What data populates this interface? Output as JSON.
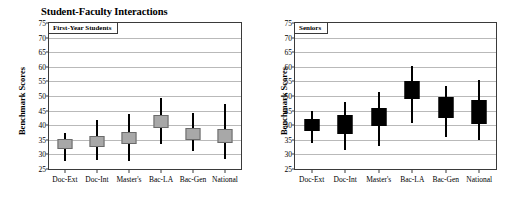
{
  "figure": {
    "title": "Student-Faculty Interactions",
    "y_axis_title": "Benchmark Scores"
  },
  "panels": [
    {
      "label": "First-Year Students"
    },
    {
      "label": "Seniors"
    }
  ],
  "axis": {
    "ticks": [
      "75",
      "70",
      "65",
      "60",
      "55",
      "50",
      "45",
      "40",
      "35",
      "30",
      "25"
    ],
    "categories": [
      "Doc-Ext",
      "Doc-Int",
      "Master's",
      "Bac-LA",
      "Bac-Gen",
      "National"
    ]
  },
  "colors": {
    "first_year_box": "#a8a8a8",
    "seniors_box": "#000000",
    "gridline": "#b9b9b9",
    "frame": "#3a3a3a"
  },
  "chart_data": [
    {
      "type": "bar",
      "subtype": "box-and-whisker",
      "title": "Student-Faculty Interactions",
      "panel_label": "First-Year Students",
      "xlabel": "",
      "ylabel": "Benchmark Scores",
      "ylim": [
        25,
        75
      ],
      "yticks": [
        25,
        30,
        35,
        40,
        45,
        50,
        55,
        60,
        65,
        70,
        75
      ],
      "grid": true,
      "legend": "none",
      "box_color": "#a8a8a8",
      "categories": [
        "Doc-Ext",
        "Doc-Int",
        "Master's",
        "Bac-LA",
        "Bac-Gen",
        "National"
      ],
      "boxes": [
        {
          "category": "Doc-Ext",
          "whisker_low": 27.8,
          "box_low": 32.0,
          "box_high": 35.2,
          "whisker_high": 37.5
        },
        {
          "category": "Doc-Int",
          "whisker_low": 28.0,
          "box_low": 32.5,
          "box_high": 36.2,
          "whisker_high": 41.8
        },
        {
          "category": "Master's",
          "whisker_low": 27.6,
          "box_low": 33.6,
          "box_high": 37.6,
          "whisker_high": 44.0
        },
        {
          "category": "Bac-LA",
          "whisker_low": 33.5,
          "box_low": 39.0,
          "box_high": 43.5,
          "whisker_high": 49.2
        },
        {
          "category": "Bac-Gen",
          "whisker_low": 31.0,
          "box_low": 35.0,
          "box_high": 39.0,
          "whisker_high": 44.2
        },
        {
          "category": "National",
          "whisker_low": 28.4,
          "box_low": 34.0,
          "box_high": 38.6,
          "whisker_high": 47.2
        }
      ]
    },
    {
      "type": "bar",
      "subtype": "box-and-whisker",
      "title": "Student-Faculty Interactions",
      "panel_label": "Seniors",
      "xlabel": "",
      "ylabel": "Benchmark Scores",
      "ylim": [
        25,
        75
      ],
      "yticks": [
        25,
        30,
        35,
        40,
        45,
        50,
        55,
        60,
        65,
        70,
        75
      ],
      "grid": true,
      "legend": "none",
      "box_color": "#000000",
      "categories": [
        "Doc-Ext",
        "Doc-Int",
        "Master's",
        "Bac-LA",
        "Bac-Gen",
        "National"
      ],
      "boxes": [
        {
          "category": "Doc-Ext",
          "whisker_low": 33.8,
          "box_low": 38.0,
          "box_high": 42.0,
          "whisker_high": 44.8
        },
        {
          "category": "Doc-Int",
          "whisker_low": 31.6,
          "box_low": 37.0,
          "box_high": 43.5,
          "whisker_high": 47.8
        },
        {
          "category": "Master's",
          "whisker_low": 33.0,
          "box_low": 39.8,
          "box_high": 46.0,
          "whisker_high": 51.2
        },
        {
          "category": "Bac-LA",
          "whisker_low": 40.8,
          "box_low": 48.8,
          "box_high": 55.0,
          "whisker_high": 60.2
        },
        {
          "category": "Bac-Gen",
          "whisker_low": 36.0,
          "box_low": 42.5,
          "box_high": 49.5,
          "whisker_high": 53.4
        },
        {
          "category": "National",
          "whisker_low": 35.0,
          "box_low": 40.4,
          "box_high": 48.5,
          "whisker_high": 55.4
        }
      ]
    }
  ]
}
